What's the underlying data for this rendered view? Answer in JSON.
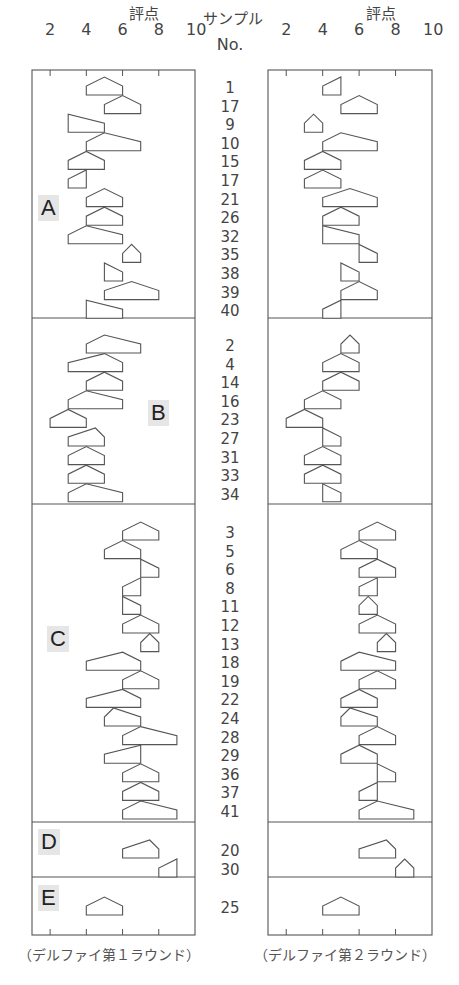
{
  "chart_data": {
    "type": "box-pentagon",
    "title": "",
    "header": {
      "score_label": "評点",
      "sample_label": "サンプル",
      "no_label": "No.",
      "ticks": [
        2,
        4,
        6,
        8,
        10
      ]
    },
    "xlim": [
      1,
      10
    ],
    "panels": [
      {
        "name": "round1",
        "caption": "（デルファイ第１ラウンド）"
      },
      {
        "name": "round2",
        "caption": "（デルファイ第２ラウンド）"
      }
    ],
    "shape_encoding": "pentagon: base spans min–max, peak at median",
    "groups": [
      {
        "label": "A",
        "samples": [
          {
            "no": "1",
            "r1": [
              4,
              5,
              6
            ],
            "r2": [
              4,
              5,
              5
            ]
          },
          {
            "no": "17",
            "r1": [
              5,
              6,
              7
            ],
            "r2": [
              5,
              6,
              7
            ]
          },
          {
            "no": "9",
            "r1": [
              3,
              3,
              5
            ],
            "r2": [
              3,
              3.5,
              4
            ]
          },
          {
            "no": "10",
            "r1": [
              4,
              5,
              7
            ],
            "r2": [
              4,
              5,
              7
            ]
          },
          {
            "no": "15",
            "r1": [
              3,
              4,
              5
            ],
            "r2": [
              3,
              4,
              5
            ]
          },
          {
            "no": "17",
            "r1": [
              3,
              4,
              4
            ],
            "r2": [
              3,
              4,
              5
            ]
          },
          {
            "no": "21",
            "r1": [
              4,
              5,
              6
            ],
            "r2": [
              4,
              5.5,
              7
            ]
          },
          {
            "no": "26",
            "r1": [
              4,
              5,
              6
            ],
            "r2": [
              4,
              5,
              6
            ]
          },
          {
            "no": "32",
            "r1": [
              3,
              4,
              6
            ],
            "r2": [
              4,
              4,
              6
            ]
          },
          {
            "no": "35",
            "r1": [
              6,
              6.5,
              7
            ],
            "r2": [
              6,
              6,
              7
            ]
          },
          {
            "no": "38",
            "r1": [
              5,
              5,
              6
            ],
            "r2": [
              5,
              5,
              6
            ]
          },
          {
            "no": "39",
            "r1": [
              5,
              6.5,
              8
            ],
            "r2": [
              5,
              6,
              7
            ]
          },
          {
            "no": "40",
            "r1": [
              4,
              4,
              6
            ],
            "r2": [
              4,
              5,
              5
            ]
          }
        ]
      },
      {
        "label": "B",
        "samples": [
          {
            "no": "2",
            "r1": [
              4,
              5,
              7
            ],
            "r2": [
              5,
              5.5,
              6
            ]
          },
          {
            "no": "4",
            "r1": [
              3,
              5,
              6
            ],
            "r2": [
              4,
              5,
              6
            ]
          },
          {
            "no": "14",
            "r1": [
              4,
              5,
              6
            ],
            "r2": [
              4,
              5,
              6
            ]
          },
          {
            "no": "16",
            "r1": [
              3,
              4,
              6
            ],
            "r2": [
              3,
              4,
              5
            ]
          },
          {
            "no": "23",
            "r1": [
              2,
              3,
              4
            ],
            "r2": [
              2,
              3,
              4
            ]
          },
          {
            "no": "27",
            "r1": [
              3,
              4.5,
              5
            ],
            "r2": [
              4,
              4,
              5
            ]
          },
          {
            "no": "31",
            "r1": [
              3,
              4,
              5
            ],
            "r2": [
              3,
              4,
              5
            ]
          },
          {
            "no": "33",
            "r1": [
              3,
              4,
              5
            ],
            "r2": [
              3,
              4,
              5
            ]
          },
          {
            "no": "34",
            "r1": [
              3,
              4,
              6
            ],
            "r2": [
              4,
              4,
              5
            ]
          }
        ]
      },
      {
        "label": "C",
        "samples": [
          {
            "no": "3",
            "r1": [
              6,
              7,
              8
            ],
            "r2": [
              6,
              7,
              8
            ]
          },
          {
            "no": "5",
            "r1": [
              5,
              6,
              7
            ],
            "r2": [
              5,
              6,
              7
            ]
          },
          {
            "no": "6",
            "r1": [
              7,
              7,
              8
            ],
            "r2": [
              6,
              7,
              8
            ]
          },
          {
            "no": "8",
            "r1": [
              6,
              7,
              7
            ],
            "r2": [
              6,
              7,
              7
            ]
          },
          {
            "no": "11",
            "r1": [
              6,
              6,
              7
            ],
            "r2": [
              6,
              6.5,
              7
            ]
          },
          {
            "no": "12",
            "r1": [
              6,
              7,
              8
            ],
            "r2": [
              6,
              7,
              8
            ]
          },
          {
            "no": "13",
            "r1": [
              7,
              7.5,
              8
            ],
            "r2": [
              7,
              7.5,
              8
            ]
          },
          {
            "no": "18",
            "r1": [
              4,
              6,
              7
            ],
            "r2": [
              5,
              6,
              8
            ]
          },
          {
            "no": "19",
            "r1": [
              6,
              7,
              8
            ],
            "r2": [
              6,
              7,
              8
            ]
          },
          {
            "no": "22",
            "r1": [
              4,
              6,
              7
            ],
            "r2": [
              5,
              6,
              7
            ]
          },
          {
            "no": "24",
            "r1": [
              5,
              5.5,
              7
            ],
            "r2": [
              5,
              5.5,
              7
            ]
          },
          {
            "no": "28",
            "r1": [
              6,
              7,
              9
            ],
            "r2": [
              6,
              7,
              8
            ]
          },
          {
            "no": "29",
            "r1": [
              5,
              7,
              7
            ],
            "r2": [
              5,
              6,
              7
            ]
          },
          {
            "no": "36",
            "r1": [
              6,
              7,
              8
            ],
            "r2": [
              7,
              7,
              8
            ]
          },
          {
            "no": "37",
            "r1": [
              6,
              7,
              8
            ],
            "r2": [
              6,
              7,
              7
            ]
          },
          {
            "no": "41",
            "r1": [
              6,
              7,
              9
            ],
            "r2": [
              6,
              7,
              9
            ]
          }
        ]
      },
      {
        "label": "D",
        "samples": [
          {
            "no": "20",
            "r1": [
              6,
              7.5,
              8
            ],
            "r2": [
              6,
              7.5,
              8
            ]
          },
          {
            "no": "30",
            "r1": [
              8,
              9,
              9
            ],
            "r2": [
              8,
              8.5,
              9
            ]
          }
        ]
      },
      {
        "label": "E",
        "samples": [
          {
            "no": "25",
            "r1": [
              4,
              5,
              6
            ],
            "r2": [
              4,
              5,
              6
            ]
          }
        ]
      }
    ]
  }
}
